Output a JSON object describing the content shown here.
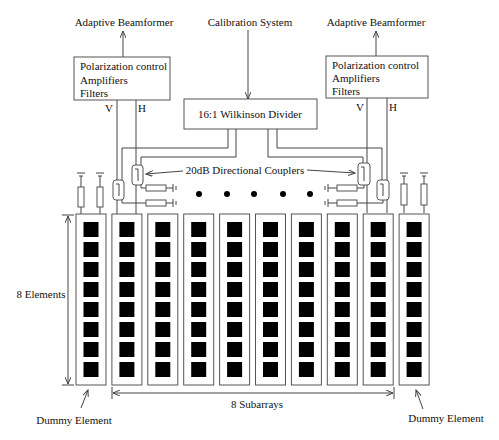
{
  "top_labels": {
    "left_beamformer": "Adaptive Beamformer",
    "calibration": "Calibration System",
    "right_beamformer": "Adaptive Beamformer"
  },
  "left_box": {
    "lines": [
      "Polarization control",
      "Amplifiers",
      "Filters"
    ],
    "v_label": "V",
    "h_label": "H"
  },
  "right_box": {
    "lines": [
      "Polarization control",
      "Amplifiers",
      "Filters"
    ],
    "v_label": "V",
    "h_label": "H"
  },
  "divider": {
    "label": "16:1 Wilkinson Divider"
  },
  "couplers_label": "20dB Directional Couplers",
  "array": {
    "columns": 10,
    "elements_per_column": 8,
    "elements_label": "8 Elements",
    "subarrays_label": "8 Subarrays",
    "dummy_left_label": "Dummy Element",
    "dummy_right_label": "Dummy Element",
    "ellipsis_dots": 5
  }
}
